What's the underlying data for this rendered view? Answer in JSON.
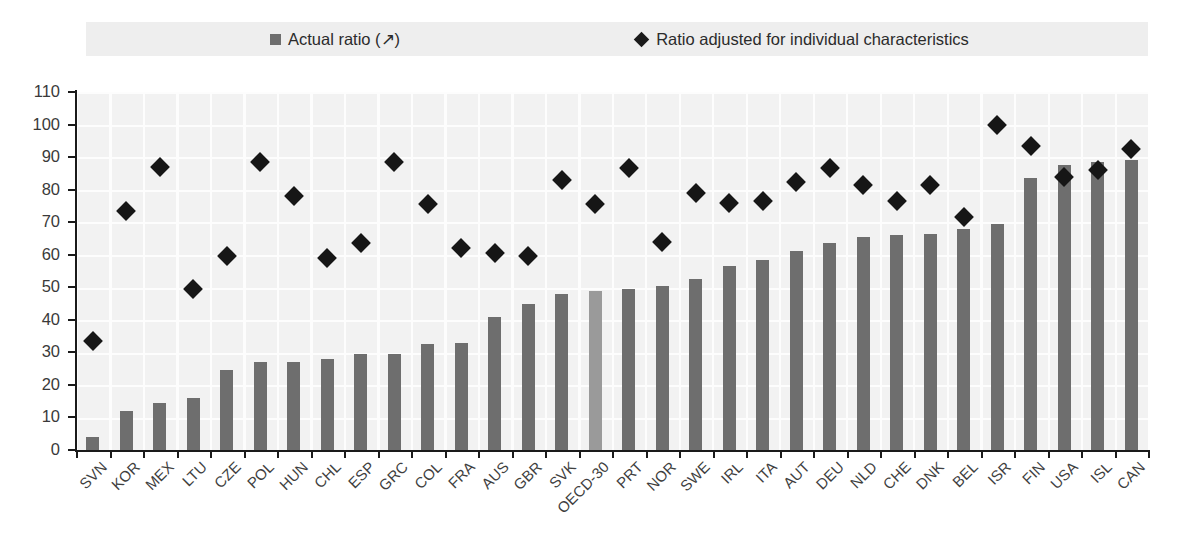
{
  "legend": {
    "position": "top",
    "entries": [
      {
        "label": "Actual ratio (↗)",
        "marker": "square",
        "color": "#6e6e6e"
      },
      {
        "label": "Ratio adjusted for individual characteristics",
        "marker": "diamond",
        "color": "#1a1a1a"
      }
    ]
  },
  "chart_data": {
    "type": "bar",
    "title": "",
    "subtitle": "",
    "xlabel": "",
    "ylabel": "",
    "ylim": [
      0,
      110
    ],
    "ytick_step": 10,
    "yticks": [
      0,
      10,
      20,
      30,
      40,
      50,
      60,
      70,
      80,
      90,
      100,
      110
    ],
    "ytick_labels": [
      "0",
      "10",
      "20",
      "30",
      "40",
      "50",
      "60",
      "70",
      "80",
      "90",
      "100",
      "110"
    ],
    "grid": true,
    "legend_position": "top",
    "highlight_category": "OECD-30",
    "categories": [
      "SVN",
      "KOR",
      "MEX",
      "LTU",
      "CZE",
      "POL",
      "HUN",
      "CHL",
      "ESP",
      "GRC",
      "COL",
      "FRA",
      "AUS",
      "GBR",
      "SVK",
      "OECD-30",
      "PRT",
      "NOR",
      "SWE",
      "IRL",
      "ITA",
      "AUT",
      "DEU",
      "NLD",
      "CHE",
      "DNK",
      "BEL",
      "ISR",
      "FIN",
      "USA",
      "ISL",
      "CAN"
    ],
    "series": [
      {
        "name": "Actual ratio (↗)",
        "type": "bar",
        "color": "#6e6e6e",
        "values": [
          4,
          12,
          14.5,
          16,
          24.5,
          27,
          27,
          28,
          29.5,
          29.5,
          32.5,
          33,
          41,
          45,
          48,
          49,
          49.5,
          50.5,
          52.5,
          56.5,
          58.5,
          61,
          63.5,
          65.5,
          66,
          66.5,
          68,
          69.5,
          83.5,
          87.5,
          88.5,
          89
        ]
      },
      {
        "name": "Ratio adjusted for individual characteristics",
        "type": "scatter",
        "marker": "diamond",
        "color": "#161616",
        "values": [
          33.5,
          73.5,
          87,
          49.5,
          59.5,
          88.5,
          78,
          59,
          63.5,
          88.5,
          75.5,
          62,
          60.5,
          59.5,
          83,
          75.5,
          86.5,
          64,
          79,
          76,
          76.5,
          82.5,
          86.5,
          81.5,
          76.5,
          81.5,
          71.5,
          100,
          93.5,
          84,
          86,
          92.5
        ]
      }
    ]
  }
}
